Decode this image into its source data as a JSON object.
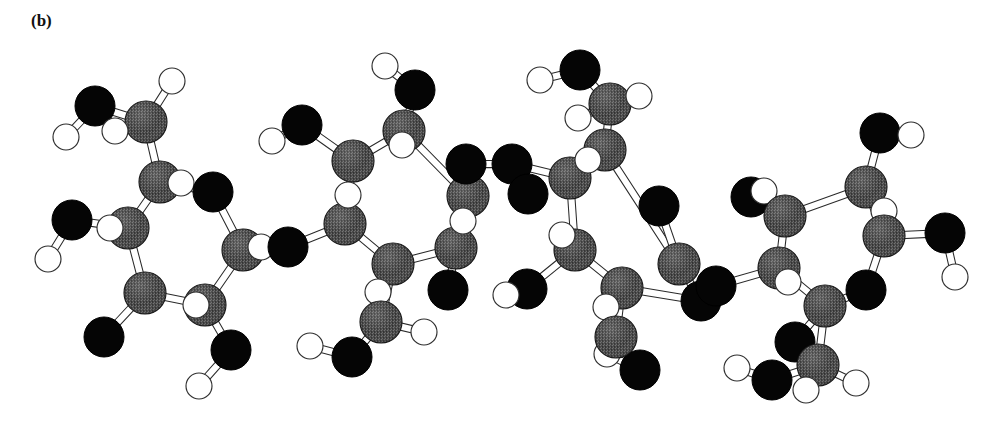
{
  "figure": {
    "panel_label": "(b)",
    "caption_visible": false,
    "background_color": "#ffffff"
  },
  "legend": {
    "carbon_color": "#4b4b4b",
    "oxygen_color": "#050505",
    "hydrogen_color": "#ffffff",
    "bond_color": "#2a2a2a"
  },
  "molecule": {
    "name": "cellulose tetrasaccharide ball-and-stick model",
    "ring_count": 4,
    "radii": {
      "C": 21,
      "O": 20,
      "H": 13
    },
    "atoms": [
      {
        "id": "r1_O2",
        "el": "O",
        "x": 95,
        "y": 106
      },
      {
        "id": "r1_H2",
        "el": "H",
        "x": 66,
        "y": 137
      },
      {
        "id": "r1_C6",
        "el": "C",
        "x": 146,
        "y": 122
      },
      {
        "id": "r1_H6a",
        "el": "H",
        "x": 172,
        "y": 81
      },
      {
        "id": "r1_H6b",
        "el": "H",
        "x": 115,
        "y": 131
      },
      {
        "id": "r1_C5",
        "el": "C",
        "x": 160,
        "y": 182
      },
      {
        "id": "r1_H5",
        "el": "H",
        "x": 181,
        "y": 183
      },
      {
        "id": "r1_Or",
        "el": "O",
        "x": 213,
        "y": 192
      },
      {
        "id": "r1_C4",
        "el": "C",
        "x": 128,
        "y": 228
      },
      {
        "id": "r1_H4",
        "el": "H",
        "x": 110,
        "y": 228
      },
      {
        "id": "r1_O4",
        "el": "O",
        "x": 72,
        "y": 220
      },
      {
        "id": "r1_H4o",
        "el": "H",
        "x": 48,
        "y": 259
      },
      {
        "id": "r1_C3",
        "el": "C",
        "x": 145,
        "y": 293
      },
      {
        "id": "r1_O3",
        "el": "O",
        "x": 104,
        "y": 337
      },
      {
        "id": "r1_C2",
        "el": "C",
        "x": 205,
        "y": 305
      },
      {
        "id": "r1_H2r",
        "el": "H",
        "x": 196,
        "y": 305
      },
      {
        "id": "r1_O2b",
        "el": "O",
        "x": 231,
        "y": 350
      },
      {
        "id": "r1_H2b",
        "el": "H",
        "x": 199,
        "y": 386
      },
      {
        "id": "r1_C1",
        "el": "C",
        "x": 243,
        "y": 250
      },
      {
        "id": "r1_H1",
        "el": "H",
        "x": 261,
        "y": 247
      },
      {
        "id": "g1_O",
        "el": "O",
        "x": 288,
        "y": 247
      },
      {
        "id": "r2_C4",
        "el": "C",
        "x": 345,
        "y": 224
      },
      {
        "id": "r2_H4",
        "el": "H",
        "x": 348,
        "y": 195
      },
      {
        "id": "r2_O4",
        "el": "O",
        "x": 302,
        "y": 125
      },
      {
        "id": "r2_H4o",
        "el": "H",
        "x": 272,
        "y": 141
      },
      {
        "id": "r2_C5",
        "el": "C",
        "x": 353,
        "y": 161
      },
      {
        "id": "r2_C6",
        "el": "C",
        "x": 404,
        "y": 131
      },
      {
        "id": "r2_O6",
        "el": "O",
        "x": 415,
        "y": 90
      },
      {
        "id": "r2_H6o",
        "el": "H",
        "x": 385,
        "y": 66
      },
      {
        "id": "r2_H6a",
        "el": "H",
        "x": 402,
        "y": 145
      },
      {
        "id": "r2_Or",
        "el": "O",
        "x": 466,
        "y": 164
      },
      {
        "id": "r2_C3",
        "el": "C",
        "x": 393,
        "y": 264
      },
      {
        "id": "r2_H3",
        "el": "H",
        "x": 378,
        "y": 292
      },
      {
        "id": "r2_C7",
        "el": "C",
        "x": 381,
        "y": 322
      },
      {
        "id": "r2_O7",
        "el": "O",
        "x": 352,
        "y": 357
      },
      {
        "id": "r2_H7o",
        "el": "H",
        "x": 310,
        "y": 346
      },
      {
        "id": "r2_H7a",
        "el": "H",
        "x": 424,
        "y": 332
      },
      {
        "id": "r2_C2",
        "el": "C",
        "x": 456,
        "y": 248
      },
      {
        "id": "r2_H2",
        "el": "H",
        "x": 463,
        "y": 221
      },
      {
        "id": "r2_C1",
        "el": "C",
        "x": 468,
        "y": 196
      },
      {
        "id": "r2_O2",
        "el": "O",
        "x": 448,
        "y": 290
      },
      {
        "id": "g2_O",
        "el": "O",
        "x": 512,
        "y": 164
      },
      {
        "id": "r3_C4",
        "el": "C",
        "x": 570,
        "y": 178
      },
      {
        "id": "r3_H4",
        "el": "H",
        "x": 588,
        "y": 160
      },
      {
        "id": "r3_C5",
        "el": "C",
        "x": 605,
        "y": 150
      },
      {
        "id": "r3_C6",
        "el": "C",
        "x": 610,
        "y": 104
      },
      {
        "id": "r3_O6",
        "el": "O",
        "x": 580,
        "y": 70
      },
      {
        "id": "r3_H6o",
        "el": "H",
        "x": 540,
        "y": 80
      },
      {
        "id": "r3_H6a",
        "el": "H",
        "x": 639,
        "y": 96
      },
      {
        "id": "r3_H6b",
        "el": "H",
        "x": 578,
        "y": 118
      },
      {
        "id": "r3_Or",
        "el": "O",
        "x": 659,
        "y": 206
      },
      {
        "id": "r3_O4",
        "el": "O",
        "x": 528,
        "y": 194
      },
      {
        "id": "r3_C3",
        "el": "C",
        "x": 575,
        "y": 250
      },
      {
        "id": "r3_H3",
        "el": "H",
        "x": 562,
        "y": 235
      },
      {
        "id": "r3_O3",
        "el": "O",
        "x": 527,
        "y": 289
      },
      {
        "id": "r3_H3o",
        "el": "H",
        "x": 506,
        "y": 295
      },
      {
        "id": "r3_C2",
        "el": "C",
        "x": 622,
        "y": 288
      },
      {
        "id": "r3_H2",
        "el": "H",
        "x": 606,
        "y": 307
      },
      {
        "id": "r3_C7",
        "el": "C",
        "x": 616,
        "y": 337
      },
      {
        "id": "r3_O7",
        "el": "O",
        "x": 640,
        "y": 370
      },
      {
        "id": "r3_H7o",
        "el": "H",
        "x": 607,
        "y": 354
      },
      {
        "id": "r3_C1",
        "el": "C",
        "x": 679,
        "y": 264
      },
      {
        "id": "r3_O2",
        "el": "O",
        "x": 701,
        "y": 301
      },
      {
        "id": "g3_O",
        "el": "O",
        "x": 716,
        "y": 286
      },
      {
        "id": "r4_C4",
        "el": "C",
        "x": 779,
        "y": 268
      },
      {
        "id": "r4_H4",
        "el": "H",
        "x": 788,
        "y": 282
      },
      {
        "id": "r4_C5",
        "el": "C",
        "x": 785,
        "y": 216
      },
      {
        "id": "r4_O5",
        "el": "O",
        "x": 751,
        "y": 197
      },
      {
        "id": "r4_H5o",
        "el": "H",
        "x": 764,
        "y": 191
      },
      {
        "id": "r4_C3",
        "el": "C",
        "x": 825,
        "y": 306
      },
      {
        "id": "r4_O3",
        "el": "O",
        "x": 795,
        "y": 342
      },
      {
        "id": "r4_C6",
        "el": "C",
        "x": 866,
        "y": 187
      },
      {
        "id": "r4_O6",
        "el": "O",
        "x": 880,
        "y": 133
      },
      {
        "id": "r4_H6o",
        "el": "H",
        "x": 911,
        "y": 135
      },
      {
        "id": "r4_H6a",
        "el": "H",
        "x": 884,
        "y": 211
      },
      {
        "id": "r4_Or",
        "el": "O",
        "x": 866,
        "y": 290
      },
      {
        "id": "r4_C1",
        "el": "C",
        "x": 884,
        "y": 236
      },
      {
        "id": "r4_O1",
        "el": "O",
        "x": 945,
        "y": 233
      },
      {
        "id": "r4_H1o",
        "el": "H",
        "x": 955,
        "y": 277
      },
      {
        "id": "r4_C7",
        "el": "C",
        "x": 818,
        "y": 365
      },
      {
        "id": "r4_O7",
        "el": "O",
        "x": 772,
        "y": 380
      },
      {
        "id": "r4_H7o",
        "el": "H",
        "x": 737,
        "y": 368
      },
      {
        "id": "r4_H7a",
        "el": "H",
        "x": 856,
        "y": 383
      },
      {
        "id": "r4_H7b",
        "el": "H",
        "x": 806,
        "y": 390
      }
    ],
    "bonds": [
      [
        "r1_O2",
        "r1_H2"
      ],
      [
        "r1_O2",
        "r1_C6"
      ],
      [
        "r1_C6",
        "r1_H6a"
      ],
      [
        "r1_C6",
        "r1_H6b"
      ],
      [
        "r1_C6",
        "r1_C5"
      ],
      [
        "r1_C5",
        "r1_H5"
      ],
      [
        "r1_C5",
        "r1_Or"
      ],
      [
        "r1_C5",
        "r1_C4"
      ],
      [
        "r1_C4",
        "r1_H4"
      ],
      [
        "r1_C4",
        "r1_O4"
      ],
      [
        "r1_O4",
        "r1_H4o"
      ],
      [
        "r1_C4",
        "r1_C3"
      ],
      [
        "r1_C3",
        "r1_O3"
      ],
      [
        "r1_C3",
        "r1_C2"
      ],
      [
        "r1_C2",
        "r1_H2r"
      ],
      [
        "r1_C2",
        "r1_O2b"
      ],
      [
        "r1_O2b",
        "r1_H2b"
      ],
      [
        "r1_C2",
        "r1_C1"
      ],
      [
        "r1_C1",
        "r1_H1"
      ],
      [
        "r1_C1",
        "r1_Or"
      ],
      [
        "r1_C1",
        "g1_O"
      ],
      [
        "g1_O",
        "r2_C4"
      ],
      [
        "r2_C4",
        "r2_H4"
      ],
      [
        "r2_C4",
        "r2_C5"
      ],
      [
        "r2_C5",
        "r2_O4"
      ],
      [
        "r2_O4",
        "r2_H4o"
      ],
      [
        "r2_C5",
        "r2_C6"
      ],
      [
        "r2_C6",
        "r2_O6"
      ],
      [
        "r2_O6",
        "r2_H6o"
      ],
      [
        "r2_C6",
        "r2_H6a"
      ],
      [
        "r2_C6",
        "r2_C1"
      ],
      [
        "r2_C1",
        "r2_Or"
      ],
      [
        "r2_C4",
        "r2_C3"
      ],
      [
        "r2_C3",
        "r2_H3"
      ],
      [
        "r2_C3",
        "r2_C7"
      ],
      [
        "r2_C7",
        "r2_O7"
      ],
      [
        "r2_O7",
        "r2_H7o"
      ],
      [
        "r2_C7",
        "r2_H7a"
      ],
      [
        "r2_C3",
        "r2_C2"
      ],
      [
        "r2_C2",
        "r2_H2"
      ],
      [
        "r2_C2",
        "r2_O2"
      ],
      [
        "r2_C2",
        "r2_Or"
      ],
      [
        "r2_Or",
        "g2_O"
      ],
      [
        "g2_O",
        "r3_C4"
      ],
      [
        "r3_C4",
        "r3_H4"
      ],
      [
        "r3_C4",
        "r3_C5"
      ],
      [
        "r3_C5",
        "r3_C6"
      ],
      [
        "r3_C6",
        "r3_O6"
      ],
      [
        "r3_O6",
        "r3_H6o"
      ],
      [
        "r3_C6",
        "r3_H6a"
      ],
      [
        "r3_C6",
        "r3_H6b"
      ],
      [
        "r3_C5",
        "r3_C1"
      ],
      [
        "r3_C4",
        "r3_C3"
      ],
      [
        "r3_C3",
        "r3_H3"
      ],
      [
        "r3_C3",
        "r3_O3"
      ],
      [
        "r3_O3",
        "r3_H3o"
      ],
      [
        "r3_C3",
        "r3_C2"
      ],
      [
        "r3_C2",
        "r3_H2"
      ],
      [
        "r3_C2",
        "r3_C7"
      ],
      [
        "r3_C7",
        "r3_O7"
      ],
      [
        "r3_O7",
        "r3_H7o"
      ],
      [
        "r3_C2",
        "r3_O2"
      ],
      [
        "r3_C1",
        "r3_Or"
      ],
      [
        "r3_C1",
        "r3_O2"
      ],
      [
        "r3_O2",
        "g3_O"
      ],
      [
        "g3_O",
        "r4_C4"
      ],
      [
        "r4_C4",
        "r4_H4"
      ],
      [
        "r4_C4",
        "r4_C5"
      ],
      [
        "r4_C5",
        "r4_O5"
      ],
      [
        "r4_O5",
        "r4_H5o"
      ],
      [
        "r4_C5",
        "r4_C6"
      ],
      [
        "r4_C6",
        "r4_O6"
      ],
      [
        "r4_O6",
        "r4_H6o"
      ],
      [
        "r4_C6",
        "r4_H6a"
      ],
      [
        "r4_C6",
        "r4_C1"
      ],
      [
        "r4_C1",
        "r4_O1"
      ],
      [
        "r4_O1",
        "r4_H1o"
      ],
      [
        "r4_C1",
        "r4_Or"
      ],
      [
        "r4_C4",
        "r4_C3"
      ],
      [
        "r4_C3",
        "r4_O3"
      ],
      [
        "r4_C3",
        "r4_Or"
      ],
      [
        "r4_C3",
        "r4_C7"
      ],
      [
        "r4_C7",
        "r4_O7"
      ],
      [
        "r4_O7",
        "r4_H7o"
      ],
      [
        "r4_C7",
        "r4_H7a"
      ],
      [
        "r4_C7",
        "r4_H7b"
      ]
    ],
    "draw_order": [
      "r1_O3",
      "r1_O2b",
      "r1_H2b",
      "r1_O4",
      "r1_H4o",
      "r1_O2",
      "r1_H2",
      "r1_H6a",
      "r1_C6",
      "r1_H6b",
      "r1_C5",
      "r1_H5",
      "r1_Or",
      "r1_C4",
      "r1_H4",
      "r1_C3",
      "r1_C2",
      "r1_H2r",
      "r1_C1",
      "r1_H1",
      "g1_O",
      "r2_O4",
      "r2_H4o",
      "r2_O6",
      "r2_H6o",
      "r2_O7",
      "r2_H7o",
      "r2_O2",
      "r2_C6",
      "r2_H6a",
      "r2_C5",
      "r2_C4",
      "r2_H4",
      "r2_C1",
      "r2_Or",
      "r2_C3",
      "r2_H3",
      "r2_C7",
      "r2_H7a",
      "r2_C2",
      "r2_H2",
      "g2_O",
      "r3_O6",
      "r3_H6o",
      "r3_O3",
      "r3_H3o",
      "r3_O7",
      "r3_H7o",
      "r3_O4",
      "r3_H6b",
      "r3_C6",
      "r3_H6a",
      "r3_C5",
      "r3_C4",
      "r3_H4",
      "r3_C1",
      "r3_Or",
      "r3_C3",
      "r3_H3",
      "r3_C2",
      "r3_H2",
      "r3_C7",
      "r3_O2",
      "g3_O",
      "r4_O5",
      "r4_H5o",
      "r4_O6",
      "r4_H6o",
      "r4_O1",
      "r4_H1o",
      "r4_O3",
      "r4_O7",
      "r4_H7o",
      "r4_C6",
      "r4_H6a",
      "r4_C5",
      "r4_C4",
      "r4_H4",
      "r4_C1",
      "r4_Or",
      "r4_C3",
      "r4_C7",
      "r4_H7a",
      "r4_H7b"
    ]
  }
}
